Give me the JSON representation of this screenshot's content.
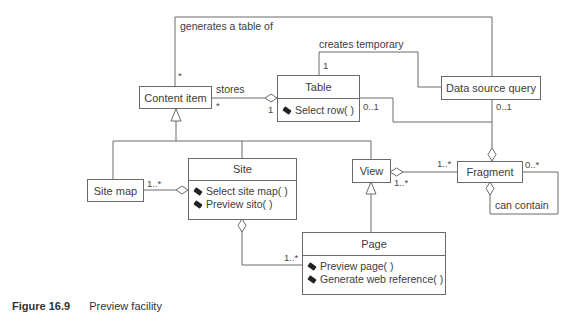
{
  "classes": {
    "content_item": {
      "name": "Content item"
    },
    "table": {
      "name": "Table",
      "operations": [
        "Select row( )"
      ]
    },
    "data_source_query": {
      "name": "Data source query"
    },
    "site_map": {
      "name": "Site map"
    },
    "site": {
      "name": "Site",
      "operations": [
        "Select site map( )",
        "Preview sito( )"
      ]
    },
    "view": {
      "name": "View"
    },
    "fragment": {
      "name": "Fragment"
    },
    "page": {
      "name": "Page",
      "operations": [
        "Preview page( )",
        "Generate web reference( )"
      ]
    }
  },
  "associations": {
    "generates": {
      "label": "generates a table of",
      "content_item_end": "*"
    },
    "creates": {
      "label": "creates temporary",
      "table_end": "1"
    },
    "stores": {
      "label": "stores",
      "content_item_end": "*",
      "table_end": "1"
    },
    "table_fragment": {
      "table_end": "0..1"
    },
    "dsq_fragment": {
      "dsq_end": "0..1"
    },
    "site_map_site": {
      "site_map_end": "1..*"
    },
    "view_fragment": {
      "fragment_end": "1..*",
      "view_end": "1..*"
    },
    "fragment_self": {
      "label": "can contain",
      "end": "0..*"
    },
    "site_page": {
      "page_end": "1..*"
    }
  },
  "caption": {
    "figure": "Figure 16.9",
    "title": "Preview facility"
  },
  "colors": {
    "line": "#6a6a6a",
    "text": "#3c3c3c",
    "background": "#ffffff"
  }
}
